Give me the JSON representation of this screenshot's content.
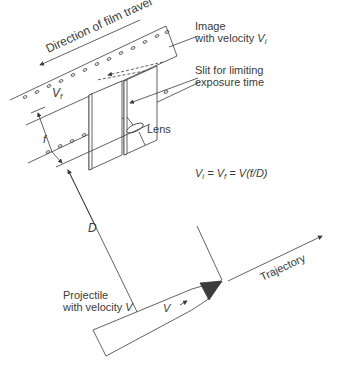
{
  "labels": {
    "film_direction": "Direction of film travel",
    "image_line1": "Image",
    "image_line2_prefix": "with velocity ",
    "image_var": "V",
    "image_sub": "i",
    "slit_line1": "Slit for limiting",
    "slit_line2": "exposure time",
    "lens": "Lens",
    "film_velocity_var": "V",
    "film_velocity_sub": "f",
    "focal_length": "f",
    "distance": "D",
    "equation": "Vᵢ = V_f = V(f/D)",
    "equation_parts": {
      "vi": "V",
      "vi_sub": "i",
      "eq1": " = ",
      "vf": "V",
      "vf_sub": "f",
      "eq2": " = ",
      "rhs": "V(f/D)"
    },
    "projectile_line1": "Projectile",
    "projectile_line2_prefix": "with velocity ",
    "projectile_var": "V",
    "projectile_arrow_label": "V",
    "trajectory": "Trajectory"
  },
  "colors": {
    "line": "#3a3a3a",
    "nose": "#3c3c3c",
    "text": "#3a3a3a"
  }
}
